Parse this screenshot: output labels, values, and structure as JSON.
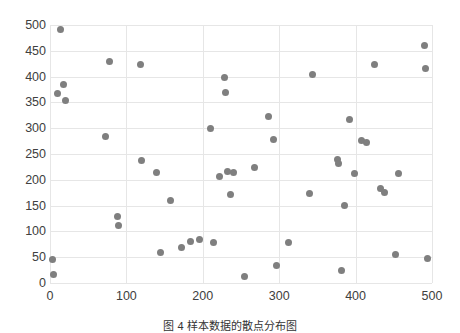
{
  "chart_data": {
    "type": "scatter",
    "title": "",
    "xlabel": "",
    "ylabel": "",
    "xlim": [
      0,
      500
    ],
    "ylim": [
      0,
      500
    ],
    "xticks": [
      0,
      100,
      200,
      300,
      400,
      500
    ],
    "yticks": [
      0,
      50,
      100,
      150,
      200,
      250,
      300,
      350,
      400,
      450,
      500
    ],
    "grid": true,
    "legend": null,
    "marker_color": "#7f7f7f",
    "series": [
      {
        "name": "series-1",
        "points": [
          [
            3,
            45
          ],
          [
            5,
            16
          ],
          [
            14,
            491
          ],
          [
            18,
            385
          ],
          [
            10,
            368
          ],
          [
            20,
            353
          ],
          [
            78,
            429
          ],
          [
            72,
            283
          ],
          [
            88,
            129
          ],
          [
            90,
            111
          ],
          [
            118,
            423
          ],
          [
            120,
            238
          ],
          [
            140,
            214
          ],
          [
            145,
            60
          ],
          [
            158,
            159
          ],
          [
            172,
            69
          ],
          [
            184,
            80
          ],
          [
            196,
            85
          ],
          [
            210,
            299
          ],
          [
            214,
            79
          ],
          [
            222,
            206
          ],
          [
            228,
            399
          ],
          [
            232,
            216
          ],
          [
            230,
            369
          ],
          [
            236,
            172
          ],
          [
            240,
            214
          ],
          [
            254,
            12
          ],
          [
            268,
            224
          ],
          [
            286,
            322
          ],
          [
            292,
            278
          ],
          [
            296,
            34
          ],
          [
            312,
            78
          ],
          [
            340,
            173
          ],
          [
            344,
            405
          ],
          [
            376,
            240
          ],
          [
            378,
            232
          ],
          [
            382,
            24
          ],
          [
            386,
            150
          ],
          [
            392,
            316
          ],
          [
            398,
            212
          ],
          [
            408,
            277
          ],
          [
            414,
            272
          ],
          [
            425,
            423
          ],
          [
            432,
            184
          ],
          [
            438,
            176
          ],
          [
            452,
            56
          ],
          [
            456,
            212
          ],
          [
            490,
            460
          ],
          [
            492,
            415
          ],
          [
            494,
            47
          ]
        ]
      }
    ]
  },
  "caption": {
    "text": "图 4  样本数据的散点分布图"
  }
}
